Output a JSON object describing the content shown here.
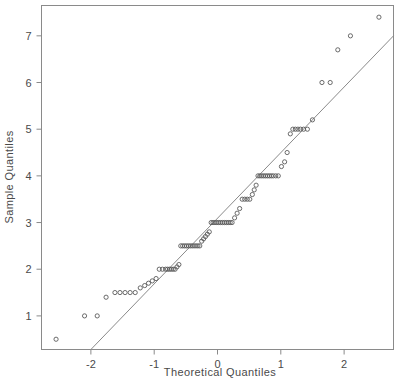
{
  "chart_data": {
    "type": "scatter",
    "title": "",
    "xlabel": "Theoretical Quantiles",
    "ylabel": "Sample Quantiles",
    "xlim": [
      -2.78,
      2.78
    ],
    "ylim": [
      0.28,
      7.65
    ],
    "xticks": [
      -2,
      -1,
      0,
      1,
      2
    ],
    "xticklabels": [
      "-2",
      "-1",
      "0",
      "1",
      "2"
    ],
    "yticks": [
      1,
      2,
      3,
      4,
      5,
      6,
      7
    ],
    "yticklabels": [
      "1",
      "2",
      "3",
      "4",
      "5",
      "6",
      "7"
    ],
    "grid": false,
    "legend": null,
    "marker": "open-circle",
    "marker_color": "#5a5a5a",
    "line_color": "#8a8a8a",
    "frame_color": "#8a8a8a",
    "reference_line": {
      "label": "qq-line",
      "x1": -2.0,
      "y1": 0.28,
      "x2": 2.78,
      "y2": 7.0
    },
    "x": [
      -2.55,
      -2.1,
      -1.9,
      -1.76,
      -1.62,
      -1.54,
      -1.46,
      -1.38,
      -1.3,
      -1.22,
      -1.15,
      -1.09,
      -1.03,
      -0.97,
      -0.92,
      -0.87,
      -0.82,
      -0.79,
      -0.76,
      -0.73,
      -0.7,
      -0.67,
      -0.64,
      -0.61,
      -0.58,
      -0.55,
      -0.52,
      -0.49,
      -0.46,
      -0.43,
      -0.4,
      -0.37,
      -0.34,
      -0.31,
      -0.28,
      -0.25,
      -0.22,
      -0.19,
      -0.16,
      -0.13,
      -0.1,
      -0.07,
      -0.04,
      -0.01,
      0.02,
      0.05,
      0.08,
      0.11,
      0.14,
      0.17,
      0.2,
      0.23,
      0.27,
      0.31,
      0.35,
      0.39,
      0.43,
      0.47,
      0.51,
      0.55,
      0.58,
      0.61,
      0.64,
      0.67,
      0.7,
      0.73,
      0.76,
      0.79,
      0.82,
      0.85,
      0.88,
      0.92,
      0.96,
      1.01,
      1.06,
      1.1,
      1.15,
      1.19,
      1.23,
      1.27,
      1.31,
      1.36,
      1.42,
      1.5,
      1.65,
      1.78,
      1.9,
      2.1,
      2.55
    ],
    "y": [
      0.5,
      1.0,
      1.0,
      1.4,
      1.5,
      1.5,
      1.5,
      1.5,
      1.5,
      1.6,
      1.65,
      1.7,
      1.75,
      1.8,
      2.0,
      2.0,
      2.0,
      2.0,
      2.0,
      2.0,
      2.0,
      2.0,
      2.05,
      2.1,
      2.5,
      2.5,
      2.5,
      2.5,
      2.5,
      2.5,
      2.5,
      2.5,
      2.5,
      2.5,
      2.5,
      2.6,
      2.65,
      2.7,
      2.75,
      2.8,
      3.0,
      3.0,
      3.0,
      3.0,
      3.0,
      3.0,
      3.0,
      3.0,
      3.0,
      3.0,
      3.0,
      3.0,
      3.1,
      3.2,
      3.3,
      3.5,
      3.5,
      3.5,
      3.5,
      3.6,
      3.7,
      3.8,
      4.0,
      4.0,
      4.0,
      4.0,
      4.0,
      4.0,
      4.0,
      4.0,
      4.0,
      4.0,
      4.0,
      4.2,
      4.3,
      4.5,
      4.9,
      5.0,
      5.0,
      5.0,
      5.0,
      5.0,
      5.0,
      5.2,
      6.0,
      6.0,
      6.7,
      7.0,
      7.4
    ]
  }
}
